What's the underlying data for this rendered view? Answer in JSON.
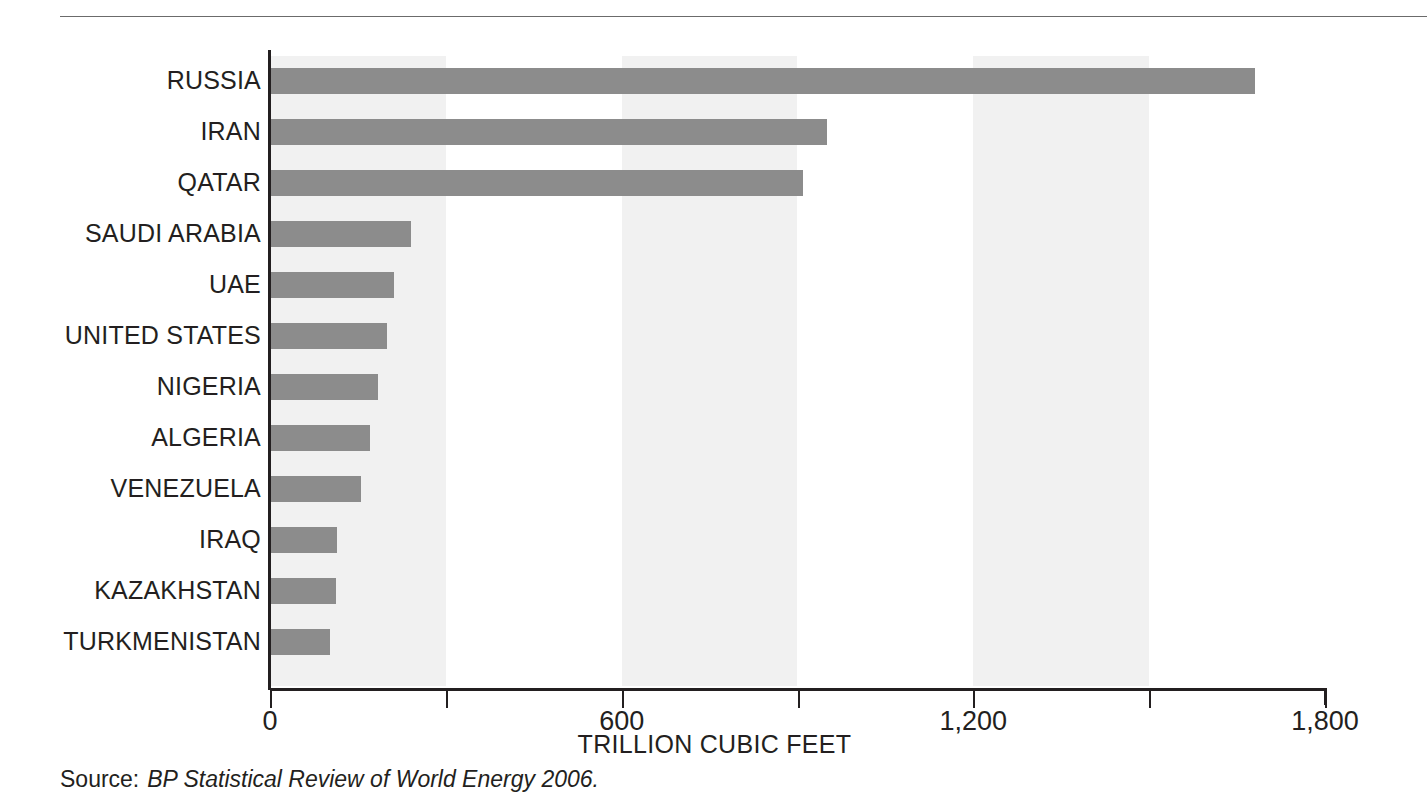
{
  "chart_data": {
    "type": "bar",
    "orientation": "horizontal",
    "title": "",
    "subtitle": "",
    "xlabel": "TRILLION CUBIC FEET",
    "ylabel": "",
    "xlim": [
      0,
      1800
    ],
    "xticks": [
      0,
      300,
      600,
      900,
      1200,
      1500,
      1800
    ],
    "xtick_labels": [
      "0",
      "",
      "600",
      "",
      "1,200",
      "",
      "1,800"
    ],
    "major_tick_values": [
      0,
      600,
      1200,
      1800
    ],
    "minor_tick_values": [
      300,
      900,
      1500
    ],
    "grid": false,
    "banding": "alternating vertical bands every 300 units",
    "legend": "none",
    "categories": [
      "RUSSIA",
      "IRAN",
      "QATAR",
      "SAUDI ARABIA",
      "UAE",
      "UNITED STATES",
      "NIGERIA",
      "ALGERIA",
      "VENEZUELA",
      "IRAQ",
      "KAZAKHSTAN",
      "TURKMENISTAN"
    ],
    "values": [
      1680,
      950,
      910,
      240,
      212,
      200,
      185,
      170,
      155,
      115,
      113,
      103
    ],
    "units": "trillion cubic feet",
    "bar_color": "#8c8c8c",
    "band_color": "#f1f1f1",
    "axis_color": "#231f20"
  },
  "source": {
    "label": "Source:",
    "citation": "BP Statistical Review of World Energy 2006."
  }
}
